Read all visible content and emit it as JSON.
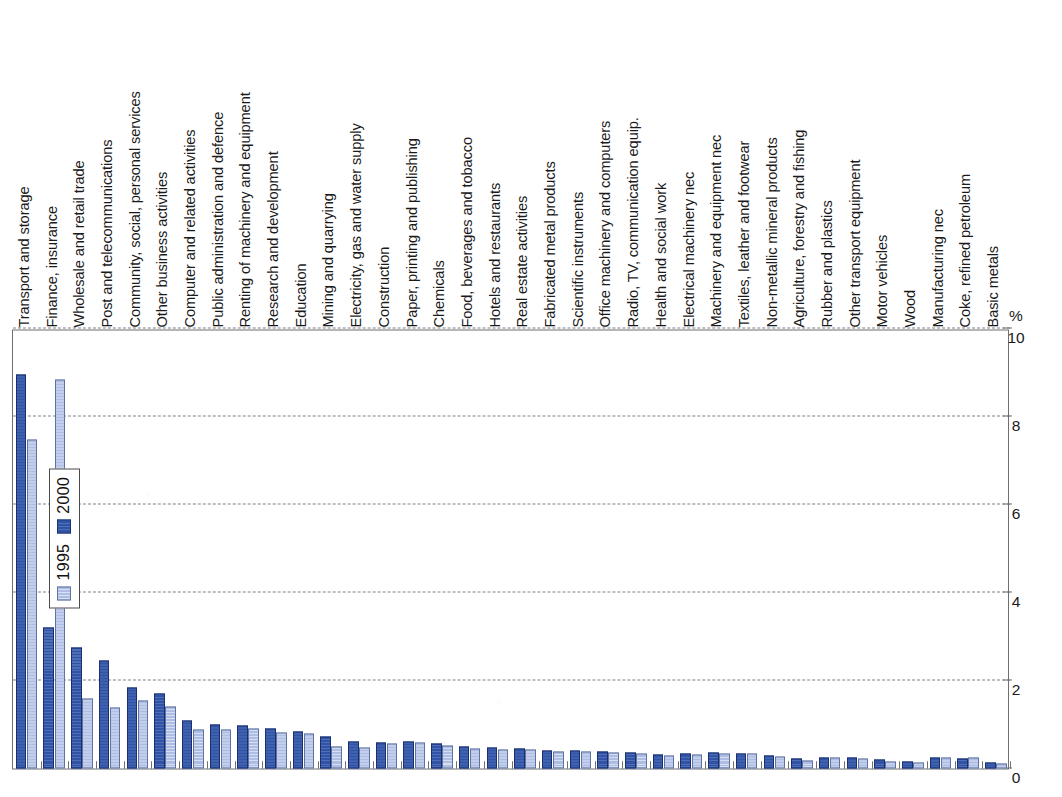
{
  "chart_data": {
    "type": "bar",
    "orientation": "vertical-rotated-90ccw",
    "title": "",
    "subtitle": "",
    "xlabel": "",
    "ylabel": "%",
    "ylim": [
      0,
      10
    ],
    "yticks": [
      0,
      2,
      4,
      6,
      8,
      10
    ],
    "ytick_labels": [
      "0",
      "2",
      "4",
      "6",
      "8",
      "10"
    ],
    "unit_label": "%",
    "grid": "horizontal-dashed",
    "legend_position": "upper-right-inside",
    "categories": [
      "Transport and storage",
      "Finance, insurance",
      "Wholesale and retail trade",
      "Post and telecommunications",
      "Community, social, personal services",
      "Other business activities",
      "Computer and related activities",
      "Public administration and defence",
      "Renting of machinery and equipment",
      "Research and development",
      "Education",
      "Mining and quarrying",
      "Electricity, gas and water supply",
      "Construction",
      "Paper, printing and publishing",
      "Chemicals",
      "Food, beverages and tobacco",
      "Hotels and restaurants",
      "Real estate activities",
      "Fabricated metal products",
      "Scientific instruments",
      "Office machinery and computers",
      "Radio, TV, communication equip.",
      "Health and social work",
      "Electrical machinery nec",
      "Machinery and equipment nec",
      "Textiles, leather and footwear",
      "Non-metallic mineral products",
      "Agriculture, forestry and fishing",
      "Rubber and plastics",
      "Other transport equipment",
      "Motor vehicles",
      "Wood",
      "Manufacturing nec",
      "Coke, refined petroleum",
      "Basic metals"
    ],
    "series": [
      {
        "name": "2000",
        "color": "#2f53a7",
        "values": [
          8.95,
          3.2,
          2.75,
          2.45,
          1.85,
          1.7,
          1.1,
          1.0,
          0.98,
          0.92,
          0.85,
          0.72,
          0.62,
          0.58,
          0.62,
          0.56,
          0.5,
          0.48,
          0.46,
          0.42,
          0.4,
          0.38,
          0.36,
          0.32,
          0.34,
          0.36,
          0.35,
          0.3,
          0.22,
          0.26,
          0.24,
          0.2,
          0.16,
          0.26,
          0.22,
          0.14
        ]
      },
      {
        "name": "1995",
        "color": "#aebde4",
        "values": [
          7.48,
          8.85,
          1.6,
          1.38,
          1.55,
          1.4,
          0.88,
          0.88,
          0.9,
          0.82,
          0.8,
          0.5,
          0.48,
          0.56,
          0.58,
          0.52,
          0.46,
          0.44,
          0.44,
          0.38,
          0.38,
          0.36,
          0.34,
          0.3,
          0.32,
          0.34,
          0.34,
          0.28,
          0.18,
          0.24,
          0.22,
          0.16,
          0.14,
          0.24,
          0.26,
          0.12
        ]
      }
    ]
  },
  "legend": {
    "items": [
      {
        "label": "2000",
        "swatch_class": "s2000"
      },
      {
        "label": "1995",
        "swatch_class": "s1995"
      }
    ]
  },
  "axis": {
    "unit": "%"
  }
}
